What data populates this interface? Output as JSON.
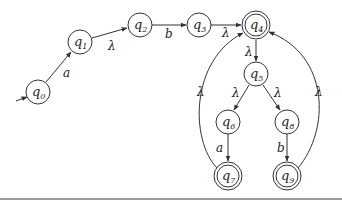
{
  "diagram": {
    "type": "finite-automaton",
    "colors": {
      "stroke": "#333333",
      "text": "#222222",
      "background": "#ffffff",
      "rule": "#9a9a9a"
    },
    "start_state": "q0",
    "states": [
      {
        "id": "q0",
        "label": "q",
        "sub": "0",
        "x": 38,
        "y": 92,
        "accepting": false
      },
      {
        "id": "q1",
        "label": "q",
        "sub": "1",
        "x": 80,
        "y": 42,
        "accepting": false
      },
      {
        "id": "q2",
        "label": "q",
        "sub": "2",
        "x": 140,
        "y": 25,
        "accepting": false
      },
      {
        "id": "q3",
        "label": "q",
        "sub": "3",
        "x": 199,
        "y": 25,
        "accepting": false
      },
      {
        "id": "q4",
        "label": "q",
        "sub": "4",
        "x": 256,
        "y": 25,
        "accepting": true
      },
      {
        "id": "q5",
        "label": "q",
        "sub": "5",
        "x": 256,
        "y": 74,
        "accepting": false
      },
      {
        "id": "q6",
        "label": "q",
        "sub": "6",
        "x": 228,
        "y": 122,
        "accepting": false
      },
      {
        "id": "q7",
        "label": "q",
        "sub": "7",
        "x": 228,
        "y": 176,
        "accepting": true
      },
      {
        "id": "q8",
        "label": "q",
        "sub": "8",
        "x": 287,
        "y": 122,
        "accepting": false
      },
      {
        "id": "q9",
        "label": "q",
        "sub": "9",
        "x": 287,
        "y": 176,
        "accepting": true
      }
    ],
    "transitions": [
      {
        "from": "q0",
        "to": "q1",
        "label": "a"
      },
      {
        "from": "q1",
        "to": "q2",
        "label": "λ"
      },
      {
        "from": "q2",
        "to": "q3",
        "label": "b"
      },
      {
        "from": "q3",
        "to": "q4",
        "label": "λ"
      },
      {
        "from": "q4",
        "to": "q5",
        "label": "λ"
      },
      {
        "from": "q5",
        "to": "q6",
        "label": "λ"
      },
      {
        "from": "q5",
        "to": "q8",
        "label": "λ"
      },
      {
        "from": "q6",
        "to": "q7",
        "label": "a"
      },
      {
        "from": "q8",
        "to": "q9",
        "label": "b"
      },
      {
        "from": "q7",
        "to": "q4",
        "label": "λ"
      },
      {
        "from": "q9",
        "to": "q4",
        "label": "λ"
      }
    ]
  }
}
